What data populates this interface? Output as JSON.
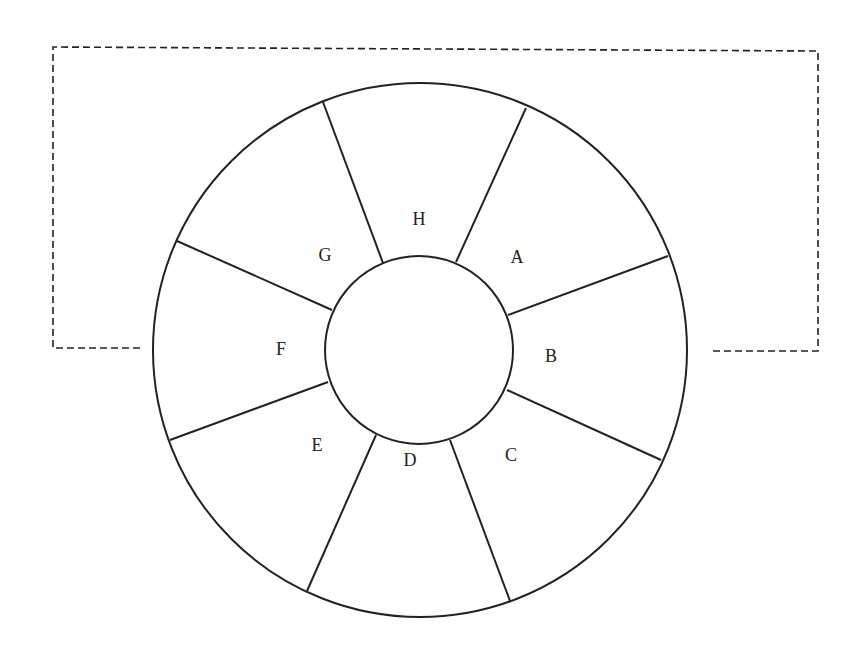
{
  "diagram": {
    "type": "segmented-ring",
    "stroke_color": "#222222",
    "background": "#ffffff",
    "outer_circle": {
      "cx": 420,
      "cy": 350,
      "r": 267
    },
    "inner_circle": {
      "cx": 419,
      "cy": 350,
      "r": 94
    },
    "segments": [
      {
        "label": "A",
        "x": 517,
        "y": 259
      },
      {
        "label": "B",
        "x": 551,
        "y": 358
      },
      {
        "label": "C",
        "x": 511,
        "y": 457
      },
      {
        "label": "D",
        "x": 410,
        "y": 462
      },
      {
        "label": "E",
        "x": 317,
        "y": 447
      },
      {
        "label": "F",
        "x": 281,
        "y": 351
      },
      {
        "label": "G",
        "x": 325,
        "y": 257
      },
      {
        "label": "H",
        "x": 419,
        "y": 221
      }
    ],
    "spokes": [
      {
        "between": "H-A",
        "x1": 456,
        "y1": 262,
        "x2": 526,
        "y2": 108
      },
      {
        "between": "A-B",
        "x1": 508,
        "y1": 315,
        "x2": 668,
        "y2": 256
      },
      {
        "between": "B-C",
        "x1": 507,
        "y1": 390,
        "x2": 661,
        "y2": 460
      },
      {
        "between": "C-D",
        "x1": 450,
        "y1": 440,
        "x2": 510,
        "y2": 601
      },
      {
        "between": "D-E",
        "x1": 376,
        "y1": 435,
        "x2": 307,
        "y2": 591
      },
      {
        "between": "E-F",
        "x1": 328,
        "y1": 382,
        "x2": 170,
        "y2": 440
      },
      {
        "between": "F-G",
        "x1": 332,
        "y1": 310,
        "x2": 177,
        "y2": 241
      },
      {
        "between": "G-H",
        "x1": 383,
        "y1": 263,
        "x2": 323,
        "y2": 102
      }
    ],
    "dashed_loop": {
      "points": "140,348 53,348 53,47 818,51 818,351 709,351"
    }
  }
}
